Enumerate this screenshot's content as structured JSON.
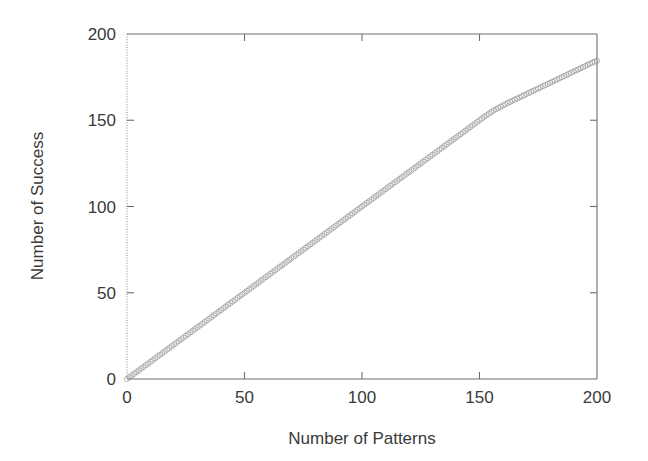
{
  "chart_data": {
    "type": "scatter",
    "title": "",
    "subtitle": "",
    "xlabel": "Number of Patterns",
    "ylabel": "Number of Success",
    "xlim": [
      0,
      200
    ],
    "ylim": [
      0,
      200
    ],
    "xticks": [
      0,
      50,
      100,
      150,
      200
    ],
    "yticks": [
      0,
      50,
      100,
      150,
      200
    ],
    "xtick_labels": [
      "0",
      "50",
      "100",
      "150",
      "200"
    ],
    "ytick_labels": [
      "0",
      "50",
      "100",
      "150",
      "200"
    ],
    "grid": false,
    "legend": null,
    "legend_position": "none",
    "marker": "open-circle",
    "marker_color": "#9a9a9a",
    "frame_color": "#6e6e6e",
    "text_color": "#3a3a3a",
    "background_color": "#ffffff",
    "annotations": [],
    "series": [
      {
        "name": "Number of Success",
        "x": [
          0,
          2,
          4,
          6,
          8,
          10,
          12,
          14,
          16,
          18,
          20,
          22,
          24,
          26,
          28,
          30,
          32,
          34,
          36,
          38,
          40,
          42,
          44,
          46,
          48,
          50,
          52,
          54,
          56,
          58,
          60,
          62,
          64,
          66,
          68,
          70,
          72,
          74,
          76,
          78,
          80,
          82,
          84,
          86,
          88,
          90,
          92,
          94,
          96,
          98,
          100,
          102,
          104,
          106,
          108,
          110,
          112,
          114,
          116,
          118,
          120,
          122,
          124,
          126,
          128,
          130,
          132,
          134,
          136,
          138,
          140,
          142,
          144,
          146,
          148,
          150,
          152,
          154,
          156,
          158,
          160,
          162,
          164,
          166,
          168,
          170,
          172,
          174,
          176,
          178,
          180,
          182,
          184,
          186,
          188,
          190,
          192,
          194,
          196,
          198,
          200
        ],
        "y": [
          0,
          2,
          4,
          6,
          8,
          10,
          12,
          14,
          16,
          18,
          20,
          22,
          24,
          26,
          28,
          30,
          32,
          34,
          36,
          38,
          40,
          42,
          44,
          46,
          48,
          50,
          52,
          54,
          56,
          58,
          60,
          62,
          64,
          66,
          68,
          70,
          72,
          74,
          76,
          78,
          80,
          82,
          84,
          86,
          88,
          90,
          92,
          94,
          96,
          98,
          100,
          102,
          104,
          106,
          108,
          110,
          112,
          114,
          116,
          118,
          120,
          122,
          124,
          126,
          128,
          130,
          132,
          134,
          136,
          138,
          140,
          142,
          144,
          146,
          148,
          150,
          152,
          153.8,
          155.6,
          157.2,
          158.6,
          160,
          161.3,
          162.6,
          163.9,
          165.2,
          166.5,
          167.8,
          169.1,
          170.4,
          171.7,
          173,
          174.3,
          175.6,
          176.9,
          178.2,
          179.5,
          180.8,
          182.1,
          183.4,
          184.5
        ]
      }
    ]
  }
}
